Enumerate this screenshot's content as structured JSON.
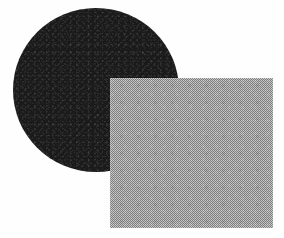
{
  "figure": {
    "background_color": "#fefefe",
    "width": 284,
    "height": 238,
    "caption": "",
    "shapes": [
      {
        "name": "circle",
        "label": "dark textured circle",
        "fill_color": "#181818",
        "texture": "grain-noise",
        "left": 13,
        "top": 8,
        "width": 166,
        "height": 164,
        "z_order": 1
      },
      {
        "name": "square",
        "label": "light gray dithered square",
        "fill_color": "#a9a9a9",
        "texture": "checkerboard-dither",
        "left": 110,
        "top": 78,
        "width": 163,
        "height": 150,
        "z_order": 2
      }
    ]
  }
}
